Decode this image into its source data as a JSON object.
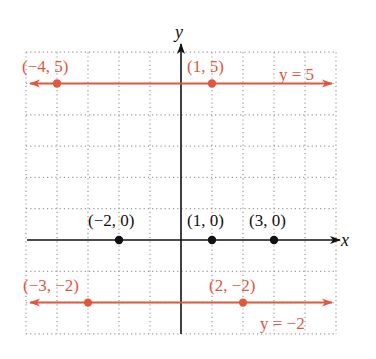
{
  "chart_data": {
    "type": "line",
    "title": "",
    "xlabel": "x",
    "ylabel": "y",
    "xlim": [
      -5,
      5
    ],
    "ylim": [
      -3,
      6
    ],
    "grid": true,
    "grid_style": "dotted",
    "series": [
      {
        "name": "y = 5",
        "label": "y = 5",
        "color": "#e0573e",
        "y": 5,
        "line": "horizontal",
        "arrows": "both",
        "points": [
          {
            "x": -4,
            "y": 5,
            "label": "(−4, 5)"
          },
          {
            "x": 1,
            "y": 5,
            "label": "(1, 5)"
          }
        ]
      },
      {
        "name": "y = -2",
        "label": "y = −2",
        "color": "#e0573e",
        "y": -2,
        "line": "horizontal",
        "arrows": "both",
        "points": [
          {
            "x": -3,
            "y": -2,
            "label": "(−3, −2)"
          },
          {
            "x": 2,
            "y": -2,
            "label": "(2, −2)"
          }
        ]
      },
      {
        "name": "x-axis points",
        "color": "#111111",
        "line": "none",
        "points": [
          {
            "x": -2,
            "y": 0,
            "label": "(−2, 0)"
          },
          {
            "x": 1,
            "y": 0,
            "label": "(1, 0)"
          },
          {
            "x": 3,
            "y": 0,
            "label": "(3, 0)"
          }
        ]
      }
    ],
    "annotations": [
      "y = 5",
      "y = −2"
    ]
  },
  "colors": {
    "accent": "#e0573e",
    "axis": "#111111",
    "grid": "#9a9a9a"
  }
}
